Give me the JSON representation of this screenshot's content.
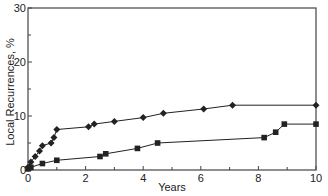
{
  "chart_data": {
    "type": "line",
    "title": "",
    "xlabel": "Years",
    "ylabel": "Local Recurrences, %",
    "xlim": [
      0,
      10
    ],
    "ylim": [
      0,
      30
    ],
    "x_ticks": [
      0,
      2,
      4,
      6,
      8,
      10
    ],
    "x_minor_ticks": [
      1,
      3,
      5,
      7,
      9
    ],
    "y_ticks": [
      0,
      10,
      20,
      30
    ],
    "y_minor_ticks": [
      5,
      15,
      25
    ],
    "grid": false,
    "legend": null,
    "series": [
      {
        "name": "diamond-series",
        "marker": "diamond",
        "color": "#222222",
        "points": [
          [
            0,
            0.5
          ],
          [
            0.1,
            1.5
          ],
          [
            0.25,
            2.5
          ],
          [
            0.4,
            3.5
          ],
          [
            0.5,
            4.5
          ],
          [
            0.8,
            5.0
          ],
          [
            0.9,
            6.0
          ],
          [
            1.0,
            7.5
          ],
          [
            2.1,
            8.0
          ],
          [
            2.3,
            8.5
          ],
          [
            3.0,
            9.0
          ],
          [
            4.0,
            9.7
          ],
          [
            4.7,
            10.5
          ],
          [
            6.1,
            11.3
          ],
          [
            7.1,
            12.0
          ],
          [
            10,
            12.0
          ]
        ]
      },
      {
        "name": "square-series",
        "marker": "square",
        "color": "#222222",
        "points": [
          [
            0,
            0.2
          ],
          [
            0.1,
            0.5
          ],
          [
            0.5,
            1.2
          ],
          [
            1.0,
            1.8
          ],
          [
            2.5,
            2.5
          ],
          [
            2.7,
            3.0
          ],
          [
            3.8,
            4.0
          ],
          [
            4.5,
            5.0
          ],
          [
            8.2,
            6.0
          ],
          [
            8.6,
            7.0
          ],
          [
            8.9,
            8.5
          ],
          [
            10,
            8.5
          ]
        ]
      }
    ]
  },
  "labels": {
    "xlabel": "Years",
    "ylabel": "Local Recurrences, %"
  }
}
